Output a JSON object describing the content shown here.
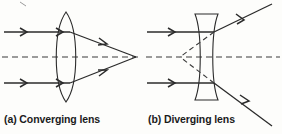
{
  "figure": {
    "type": "optics-ray-diagram",
    "background_color": "#fdfdfb",
    "line_color": "#2b2b2b",
    "dashed_color": "#3a3a3a",
    "panels": [
      {
        "id": "a",
        "caption": "(a) Converging lens",
        "lens_type": "biconvex",
        "lens_name": "Converging lens",
        "optical_axis_label": "principal axis",
        "focal_point_type": "real",
        "ray_count": 2,
        "ray_direction": "left-to-right",
        "rays_converge": "true"
      },
      {
        "id": "b",
        "caption": "(b) Diverging lens",
        "lens_type": "biconcave",
        "lens_name": "Diverging lens",
        "optical_axis_label": "principal axis",
        "focal_point_type": "virtual",
        "ray_count": 2,
        "ray_direction": "left-to-right",
        "rays_converge": "false"
      }
    ]
  },
  "captions": {
    "a": "(a) Converging lens",
    "b": "(b) Diverging lens"
  }
}
